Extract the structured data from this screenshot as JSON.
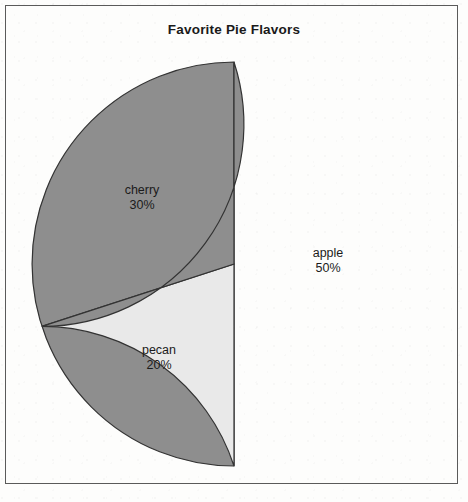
{
  "figure": {
    "width": 468,
    "height": 502,
    "background_color": "#fdfdfc",
    "frame_color": "#5a5a5a"
  },
  "chart_data": {
    "type": "pie",
    "title": "Favorite Pie Flavors",
    "xlabel": "",
    "ylabel": "",
    "categories": [
      "apple",
      "cherry",
      "pecan"
    ],
    "values": [
      50,
      30,
      20
    ],
    "value_unit": "%",
    "labels": [
      "apple",
      "cherry",
      "pecan"
    ],
    "percent_labels": [
      "50%",
      "30%",
      "20%"
    ],
    "colors": [
      "#8e8e8e",
      "#8e8e8e",
      "#e9e9e9"
    ],
    "edge_color": "#333333",
    "start_angle_deg": 90,
    "direction": "clockwise",
    "legend": "none",
    "grid": false,
    "center": {
      "x": 234,
      "y": 264
    },
    "radius": 202,
    "slices": [
      {
        "name": "apple",
        "percent": "50%",
        "value": 50,
        "color": "#8e8e8e",
        "label_x": 328,
        "label_y": 246
      },
      {
        "name": "cherry",
        "percent": "30%",
        "value": 30,
        "color": "#8e8e8e",
        "label_x": 142,
        "label_y": 183
      },
      {
        "name": "pecan",
        "percent": "20%",
        "value": 20,
        "color": "#e9e9e9",
        "label_x": 159,
        "label_y": 343
      }
    ]
  }
}
